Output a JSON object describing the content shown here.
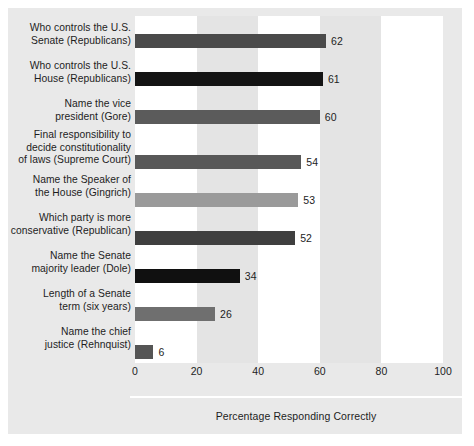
{
  "chart_data": {
    "type": "bar",
    "orientation": "horizontal",
    "title": "",
    "xlabel": "Percentage Responding Correctly",
    "ylabel": "",
    "xlim": [
      0,
      100
    ],
    "xticks": [
      "0",
      "20",
      "40",
      "60",
      "80",
      "100"
    ],
    "grid": false,
    "legend": "none",
    "band_shading": "alternating vertical bands every 20 units",
    "categories": [
      "Who controls the U.S. Senate (Republicans)",
      "Who controls the U.S. House (Republicans)",
      "Name the vice president (Gore)",
      "Final responsibility to decide constitutionality of laws (Supreme Court)",
      "Name the Speaker of the House (Gingrich)",
      "Which party is more conservative (Republican)",
      "Name the Senate majority leader (Dole)",
      "Length of a Senate term (six years)",
      "Name the chief justice (Rehnquist)"
    ],
    "values": [
      62,
      61,
      60,
      54,
      53,
      52,
      34,
      26,
      6
    ],
    "value_labels": [
      "62",
      "61",
      "60",
      "54",
      "53",
      "52",
      "34",
      "26",
      "6"
    ],
    "bar_colors": [
      "#4a4a4a",
      "#141414",
      "#5b5b5b",
      "#585858",
      "#9a9a9a",
      "#3f3f3f",
      "#101010",
      "#6f6f6f",
      "#555555"
    ],
    "category_lines": [
      [
        "Who controls the U.S.",
        "Senate (Republicans)"
      ],
      [
        "Who controls the U.S.",
        "House (Republicans)"
      ],
      [
        "Name the vice",
        "president (Gore)"
      ],
      [
        "Final responsibility to",
        "decide constitutionality",
        "of laws (Supreme Court)"
      ],
      [
        "Name the Speaker of",
        "the House (Gingrich)"
      ],
      [
        "Which party is more",
        "conservative (Republican)"
      ],
      [
        "Name the Senate",
        "majority leader (Dole)"
      ],
      [
        "Length of a Senate",
        "term (six years)"
      ],
      [
        "Name the chief",
        "justice (Rehnquist)"
      ]
    ]
  },
  "colors": {
    "panel_background": "#e9e9e9",
    "band_light": "#ffffff",
    "band_shaded": "#e4e4e4",
    "text": "#1d1d1d",
    "separator": "#ffffff"
  }
}
